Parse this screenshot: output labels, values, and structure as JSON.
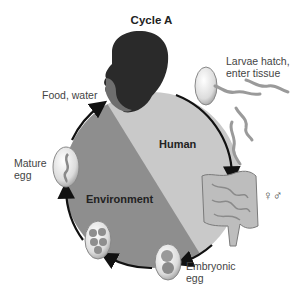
{
  "diagram": {
    "title": "Cycle A",
    "regions": {
      "human": "Human",
      "environment": "Environment"
    },
    "stages": {
      "food_water": "Food, water",
      "larvae_line1": "Larvae hatch,",
      "larvae_line2": "enter tissue",
      "sexes": "♀♂",
      "embryonic_line1": "Embryonic",
      "embryonic_line2": "egg",
      "mature_line1": "Mature",
      "mature_line2": "egg"
    },
    "colors": {
      "human_region": "#c9c9c9",
      "environment_region": "#8e8e8e",
      "arrow": "#111111",
      "egg_shell": "#e6e6e6",
      "worm": "#9a9a9a"
    }
  }
}
